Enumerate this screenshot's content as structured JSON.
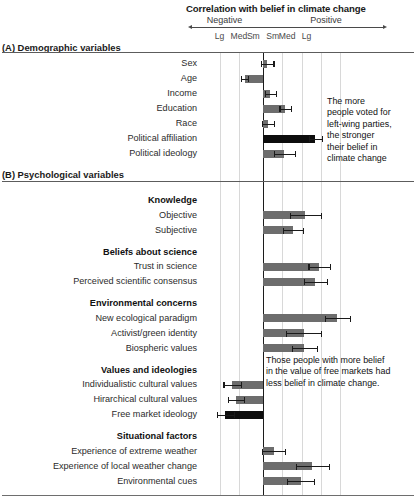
{
  "figure": {
    "title": "Correlation with belief in climate change",
    "direction_labels": {
      "negative": "Negative",
      "positive": "Positive"
    },
    "tick_labels": [
      "Lg",
      "Med",
      "Sm",
      "Sm",
      "Med",
      "Lg"
    ]
  },
  "sections": [
    {
      "id": "A",
      "heading": "(A) Demographic variables"
    },
    {
      "id": "B",
      "heading": "(B) Psychological variables"
    }
  ],
  "annotations": [
    {
      "id": "annotation-political-affiliation",
      "text": "The more\npeople voted for\nleft-wing parties,\nthe stronger\ntheir belief in\nclimate change"
    },
    {
      "id": "annotation-free-market",
      "text": "Those people with more belief\nin the value of free markets had\nless belief in climate change."
    }
  ],
  "chart_data": {
    "type": "bar",
    "orientation": "horizontal",
    "title": "Correlation with belief in climate change",
    "xlabel": "Correlation with belief in climate change",
    "ylabel": "",
    "xlim": [
      -2.75,
      4.5
    ],
    "axis_units": "effect-size magnitude categories",
    "tick_positions": [
      -2.25,
      -1.25,
      -0.5,
      0.5,
      1.25,
      2.25
    ],
    "tick_labels": [
      "Lg",
      "Med",
      "Sm",
      "Sm",
      "Med",
      "Lg"
    ],
    "gridlines": [
      -2.25,
      -1.25,
      1.0,
      2.0,
      3.0,
      4.0
    ],
    "grid": true,
    "legend": "none",
    "zero_line": 0,
    "bar_color": "#6d6d6d",
    "highlight_color": "#0d0d0d",
    "groups": [
      {
        "section": "(A) Demographic variables",
        "group": "",
        "rows": [
          {
            "label": "Sex",
            "value": 0.22,
            "error": 0.32,
            "highlight": false
          },
          {
            "label": "Age",
            "value": -0.95,
            "error": 0.18,
            "highlight": false
          },
          {
            "label": "Income",
            "value": 0.38,
            "error": 0.28,
            "highlight": false
          },
          {
            "label": "Education",
            "value": 1.15,
            "error": 0.3,
            "highlight": false
          },
          {
            "label": "Race",
            "value": 0.25,
            "error": 0.32,
            "highlight": false
          },
          {
            "label": "Political affiliation",
            "value": 2.7,
            "error": 0.34,
            "highlight": true
          },
          {
            "label": "Political ideology",
            "value": 1.1,
            "error": 0.55,
            "highlight": false
          }
        ]
      },
      {
        "section": "(B) Psychological variables",
        "group": "Knowledge",
        "rows": [
          {
            "label": "Objective",
            "value": 2.2,
            "error": 0.8,
            "highlight": false
          },
          {
            "label": "Subjective",
            "value": 1.55,
            "error": 0.5,
            "highlight": false
          }
        ]
      },
      {
        "section": "(B) Psychological variables",
        "group": "Beliefs about science",
        "rows": [
          {
            "label": "Trust in science",
            "value": 2.9,
            "error": 0.55,
            "highlight": false
          },
          {
            "label": "Perceived scientific consensus",
            "value": 2.7,
            "error": 0.6,
            "highlight": false
          }
        ]
      },
      {
        "section": "(B) Psychological variables",
        "group": "Environmental concerns",
        "rows": [
          {
            "label": "New ecological paradigm",
            "value": 3.85,
            "error": 0.65,
            "highlight": false
          },
          {
            "label": "Activist/green identity",
            "value": 2.1,
            "error": 0.9,
            "highlight": false
          },
          {
            "label": "Biospheric values",
            "value": 2.15,
            "error": 0.65,
            "highlight": false
          }
        ]
      },
      {
        "section": "(B) Psychological variables",
        "group": "Values and ideologies",
        "rows": [
          {
            "label": "Individualistic cultural values",
            "value": -1.6,
            "error": 0.45,
            "highlight": false
          },
          {
            "label": "Hirarchical cultural values",
            "value": -1.4,
            "error": 0.4,
            "highlight": false
          },
          {
            "label": "Free market ideology",
            "value": -1.95,
            "error": 0.45,
            "highlight": true
          }
        ]
      },
      {
        "section": "(B) Psychological variables",
        "group": "Situational factors",
        "rows": [
          {
            "label": "Experience of extreme weather",
            "value": 0.55,
            "error": 0.6,
            "highlight": false
          },
          {
            "label": "Experience of local weather change",
            "value": 2.55,
            "error": 0.85,
            "highlight": false
          },
          {
            "label": "Environmental cues",
            "value": 1.95,
            "error": 0.7,
            "highlight": false
          }
        ]
      }
    ]
  }
}
